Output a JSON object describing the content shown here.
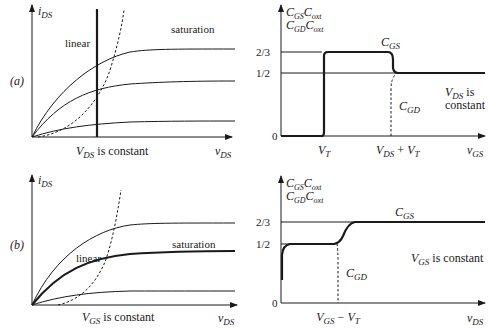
{
  "panels": {
    "a": {
      "label": "(a)",
      "iv": {
        "ylabel_main": "i",
        "ylabel_sub": "DS",
        "xlabel_main": "v",
        "xlabel_sub": "DS",
        "region_linear": "linear",
        "region_saturation": "saturation",
        "constant_main": "V",
        "constant_sub": "DS",
        "constant_rest": " is constant"
      },
      "cap": {
        "ylabel_line1_a": "C",
        "ylabel_line1_a_sub": "GS",
        "ylabel_line1_b": "C",
        "ylabel_line1_b_sub": "oxt",
        "ylabel_line2_a": "C",
        "ylabel_line2_a_sub": "GD",
        "ylabel_line2_b": "C",
        "ylabel_line2_b_sub": "oxt",
        "tick_2_3": "2/3",
        "tick_1_2": "1/2",
        "tick_0": "0",
        "curve_cgs_main": "C",
        "curve_cgs_sub": "GS",
        "curve_cgd_main": "C",
        "curve_cgd_sub": "GD",
        "xtick_vt_main": "V",
        "xtick_vt_sub": "T",
        "xtick_2_a": "V",
        "xtick_2_a_sub": "DS",
        "xtick_2_op": " + ",
        "xtick_2_b": "V",
        "xtick_2_b_sub": "T",
        "xlabel_main": "v",
        "xlabel_sub": "GS",
        "note_line1_main": "V",
        "note_line1_sub": "DS",
        "note_line1_rest": " is",
        "note_line2": "constant"
      }
    },
    "b": {
      "label": "(b)",
      "iv": {
        "ylabel_main": "i",
        "ylabel_sub": "DS",
        "xlabel_main": "v",
        "xlabel_sub": "DS",
        "region_linear": "linear",
        "region_saturation": "saturation",
        "constant_main": "V",
        "constant_sub": "GS",
        "constant_rest": " is constant"
      },
      "cap": {
        "ylabel_line1_a": "C",
        "ylabel_line1_a_sub": "GS",
        "ylabel_line1_b": "C",
        "ylabel_line1_b_sub": "oxt",
        "ylabel_line2_a": "C",
        "ylabel_line2_a_sub": "GD",
        "ylabel_line2_b": "C",
        "ylabel_line2_b_sub": "oxt",
        "tick_2_3": "2/3",
        "tick_1_2": "1/2",
        "tick_0": "0",
        "curve_cgs_main": "C",
        "curve_cgs_sub": "GS",
        "curve_cgd_main": "C",
        "curve_cgd_sub": "GD",
        "xtick_main_a": "V",
        "xtick_main_a_sub": "GS",
        "xtick_op": " − ",
        "xtick_main_b": "V",
        "xtick_main_b_sub": "T",
        "xlabel_main": "v",
        "xlabel_sub": "DS",
        "note_main": "V",
        "note_sub": "GS",
        "note_rest": " is constant"
      }
    }
  }
}
